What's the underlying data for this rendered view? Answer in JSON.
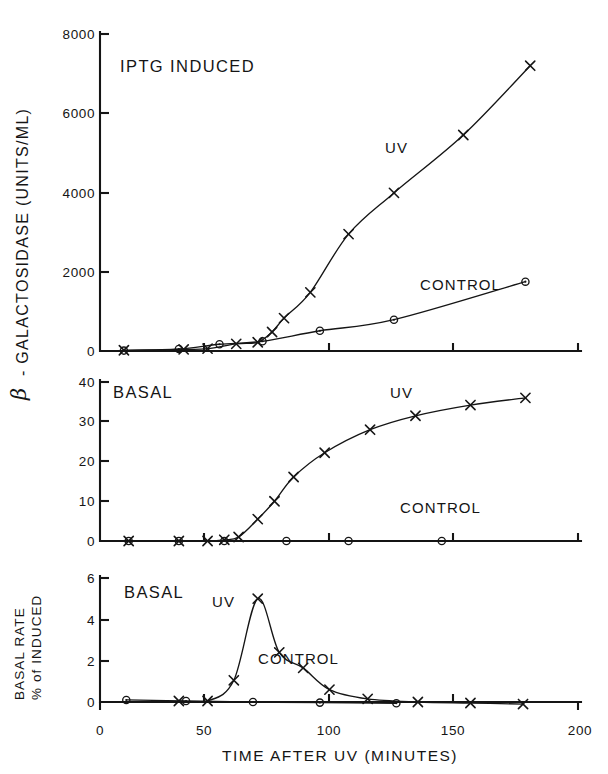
{
  "figure": {
    "background_color": "#ffffff",
    "ink_color": "#151515",
    "x_axis_title": "TIME AFTER UV (MINUTES)",
    "y_axis_title_main": "β - GALACTOSIDASE  (UNITS/ML)",
    "y_axis_title_beta": "β",
    "y_axis_title_rest": "- GALACTOSIDASE  (UNITS/ML)",
    "y_axis_title_bottom_line1": "BASAL RATE",
    "y_axis_title_bottom_line2": "% of INDUCED",
    "top_cut_text": ""
  },
  "chart_data": [
    {
      "type": "line",
      "panel_id": "panel-iptg-induced",
      "title": "IPTG INDUCED",
      "xlabel": "TIME AFTER UV (MINUTES)",
      "ylabel": "β - GALACTOSIDASE (UNITS/ML)",
      "xlim": [
        0,
        200
      ],
      "ylim": [
        0,
        8000
      ],
      "xticks": [
        0,
        50,
        100,
        150,
        200
      ],
      "yticks": [
        0,
        2000,
        4000,
        6000,
        8000
      ],
      "ytick_labels": [
        "0",
        "2000",
        "4000",
        "6000",
        "8000"
      ],
      "grid": false,
      "legend": "inline-annotations",
      "series": [
        {
          "name": "UV",
          "marker": "x",
          "label_x": 123,
          "label_y": 5000,
          "points": [
            {
              "x": 10,
              "y": 20
            },
            {
              "x": 35,
              "y": 40
            },
            {
              "x": 45,
              "y": 60
            },
            {
              "x": 57,
              "y": 180
            },
            {
              "x": 66,
              "y": 220
            },
            {
              "x": 72,
              "y": 480
            },
            {
              "x": 77,
              "y": 830
            },
            {
              "x": 88,
              "y": 1480
            },
            {
              "x": 104,
              "y": 2950
            },
            {
              "x": 123,
              "y": 3990
            },
            {
              "x": 152,
              "y": 5450
            },
            {
              "x": 180,
              "y": 7200
            }
          ]
        },
        {
          "name": "CONTROL",
          "marker": "o",
          "label_x": 143,
          "label_y": 1900,
          "points": [
            {
              "x": 10,
              "y": 10
            },
            {
              "x": 33,
              "y": 50
            },
            {
              "x": 50,
              "y": 170
            },
            {
              "x": 68,
              "y": 245
            },
            {
              "x": 92,
              "y": 510
            },
            {
              "x": 123,
              "y": 790
            },
            {
              "x": 178,
              "y": 1750
            }
          ]
        }
      ]
    },
    {
      "type": "line",
      "panel_id": "panel-basal-units",
      "title": "BASAL",
      "xlabel": "TIME AFTER UV (MINUTES)",
      "ylabel": "β - GALACTOSIDASE (UNITS/ML)",
      "xlim": [
        0,
        200
      ],
      "ylim": [
        0,
        40
      ],
      "xticks": [
        0,
        50,
        100,
        150,
        200
      ],
      "yticks": [
        0,
        10,
        20,
        30,
        40
      ],
      "ytick_labels": [
        "0",
        "10",
        "20",
        "30",
        "40"
      ],
      "grid": false,
      "legend": "inline-annotations",
      "series": [
        {
          "name": "UV",
          "marker": "x",
          "label_x": 126,
          "label_y": 38,
          "points": [
            {
              "x": 12,
              "y": 0
            },
            {
              "x": 33,
              "y": 0
            },
            {
              "x": 45,
              "y": 0
            },
            {
              "x": 52,
              "y": 0.3
            },
            {
              "x": 58,
              "y": 1.0
            },
            {
              "x": 66,
              "y": 5.5
            },
            {
              "x": 73,
              "y": 10.0
            },
            {
              "x": 81,
              "y": 16.1
            },
            {
              "x": 94,
              "y": 22.2
            },
            {
              "x": 113,
              "y": 28.0
            },
            {
              "x": 132,
              "y": 31.5
            },
            {
              "x": 155,
              "y": 34.2
            },
            {
              "x": 178,
              "y": 36.0
            }
          ]
        },
        {
          "name": "CONTROL",
          "marker": "o",
          "label_x": 130,
          "label_y": 9.5,
          "points": [
            {
              "x": 12,
              "y": 0
            },
            {
              "x": 33,
              "y": 0
            },
            {
              "x": 52,
              "y": 0
            },
            {
              "x": 78,
              "y": 0
            },
            {
              "x": 104,
              "y": 0
            },
            {
              "x": 143,
              "y": 0
            }
          ]
        }
      ]
    },
    {
      "type": "line",
      "panel_id": "panel-basal-rate",
      "title": "BASAL",
      "xlabel": "TIME AFTER UV (MINUTES)",
      "ylabel": "BASAL RATE % of INDUCED",
      "xlim": [
        0,
        200
      ],
      "ylim": [
        0,
        6
      ],
      "xticks": [
        0,
        50,
        100,
        150,
        200
      ],
      "yticks": [
        0,
        2,
        4,
        6
      ],
      "ytick_labels": [
        "0",
        "2",
        "4",
        "6"
      ],
      "grid": false,
      "legend": "inline-annotations",
      "series": [
        {
          "name": "UV",
          "marker": "x",
          "label_x": 52,
          "label_y": 4.35,
          "points": [
            {
              "x": 33,
              "y": 0.05
            },
            {
              "x": 45,
              "y": 0.05
            },
            {
              "x": 56,
              "y": 1.05
            },
            {
              "x": 66,
              "y": 5.0
            },
            {
              "x": 75,
              "y": 2.4
            },
            {
              "x": 85,
              "y": 1.65
            },
            {
              "x": 96,
              "y": 0.6
            },
            {
              "x": 112,
              "y": 0.15
            },
            {
              "x": 133,
              "y": 0.0
            },
            {
              "x": 155,
              "y": -0.05
            },
            {
              "x": 177,
              "y": -0.1
            }
          ]
        },
        {
          "name": "CONTROL",
          "marker": "o",
          "label_x": 68,
          "label_y": 1.15,
          "points": [
            {
              "x": 11,
              "y": 0.1
            },
            {
              "x": 36,
              "y": 0.05
            },
            {
              "x": 64,
              "y": 0.0
            },
            {
              "x": 92,
              "y": -0.03
            },
            {
              "x": 124,
              "y": -0.06
            }
          ]
        }
      ]
    }
  ],
  "panels": [
    {
      "id": "panel-iptg-induced",
      "title": "IPTG INDUCED",
      "series_labels": [
        "UV",
        "CONTROL"
      ],
      "ytick_labels": [
        "8000",
        "6000",
        "4000",
        "2000",
        "0"
      ]
    },
    {
      "id": "panel-basal-units",
      "title": "BASAL",
      "series_labels": [
        "UV",
        "CONTROL"
      ],
      "ytick_labels": [
        "40",
        "30",
        "20",
        "10",
        "0"
      ]
    },
    {
      "id": "panel-basal-rate",
      "title": "BASAL",
      "series_labels": [
        "UV",
        "CONTROL"
      ],
      "ytick_labels": [
        "6",
        "4",
        "2",
        "0"
      ]
    }
  ],
  "xtick_labels": [
    "0",
    "50",
    "100",
    "150",
    "200"
  ]
}
